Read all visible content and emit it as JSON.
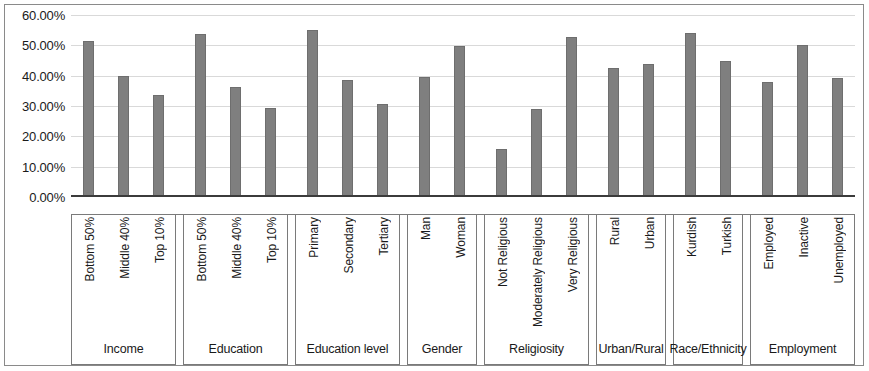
{
  "chart_data": {
    "type": "bar",
    "title": "",
    "xlabel": "",
    "ylabel": "",
    "ylim": [
      0,
      60
    ],
    "grid": true,
    "legend": "none",
    "y_ticks": [
      "0.00%",
      "10.00%",
      "20.00%",
      "30.00%",
      "40.00%",
      "50.00%",
      "60.00%"
    ],
    "y_tick_values": [
      0,
      10,
      20,
      30,
      40,
      50,
      60
    ],
    "bar_color": "#7f7f7f",
    "groups": [
      {
        "group": "Income",
        "categories": [
          "Bottom 50%",
          "Middle 40%",
          "Top 10%"
        ],
        "values": [
          51.3,
          39.8,
          33.6
        ]
      },
      {
        "group": "Education",
        "categories": [
          "Bottom 50%",
          "Middle 40%",
          "Top 10%"
        ],
        "values": [
          53.8,
          36.2,
          29.2
        ]
      },
      {
        "group": "Education level",
        "categories": [
          "Primary",
          "Secondary",
          "Tertiary"
        ],
        "values": [
          54.9,
          38.7,
          30.7
        ]
      },
      {
        "group": "Gender",
        "categories": [
          "Man",
          "Woman"
        ],
        "values": [
          39.7,
          49.7
        ]
      },
      {
        "group": "Religiosity",
        "categories": [
          "Not Religious",
          "Moderately Religious",
          "Very Religious"
        ],
        "values": [
          15.8,
          29.0,
          52.6
        ]
      },
      {
        "group": "Urban/Rural",
        "categories": [
          "Rural",
          "Urban"
        ],
        "values": [
          42.5,
          43.9
        ]
      },
      {
        "group": "Race/Ethnicity",
        "categories": [
          "Kurdish",
          "Turkish"
        ],
        "values": [
          54.1,
          44.8
        ]
      },
      {
        "group": "Employment",
        "categories": [
          "Employed",
          "Inactive",
          "Unemployed"
        ],
        "values": [
          38.0,
          50.1,
          39.4
        ]
      }
    ],
    "categories": [
      "Bottom 50%",
      "Middle 40%",
      "Top 10%",
      "Bottom 50%",
      "Middle 40%",
      "Top 10%",
      "Primary",
      "Secondary",
      "Tertiary",
      "Man",
      "Woman",
      "Not Religious",
      "Moderately Religious",
      "Very Religious",
      "Rural",
      "Urban",
      "Kurdish",
      "Turkish",
      "Employed",
      "Inactive",
      "Unemployed"
    ],
    "values": [
      51.3,
      39.8,
      33.6,
      53.8,
      36.2,
      29.2,
      54.9,
      38.7,
      30.7,
      39.7,
      49.7,
      15.8,
      29.0,
      52.6,
      42.5,
      43.9,
      54.1,
      44.8,
      38.0,
      50.1,
      39.4
    ]
  }
}
